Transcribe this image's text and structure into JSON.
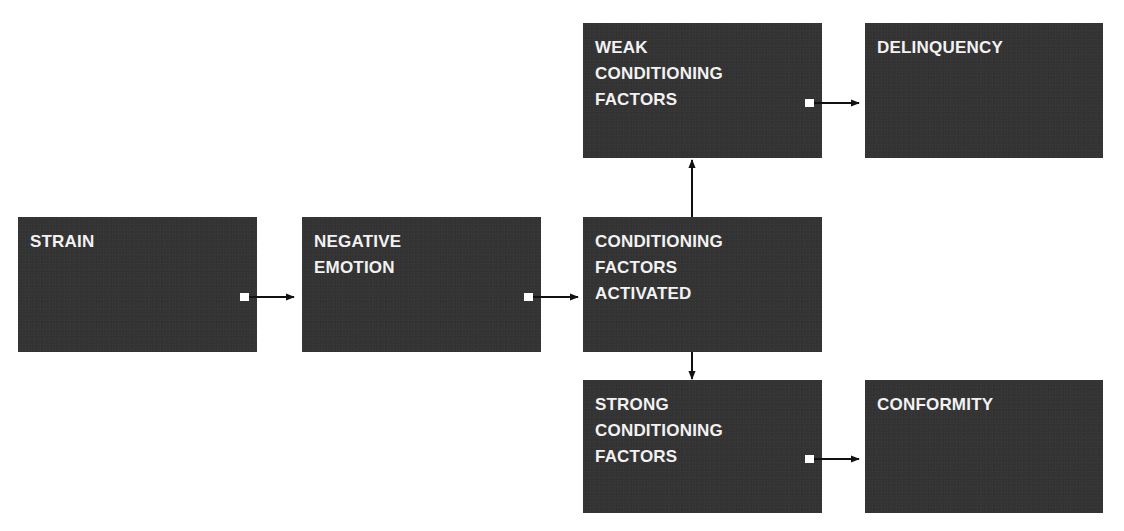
{
  "diagram": {
    "type": "flowchart",
    "box_fill": "#343434",
    "text_color": "#f2f2f2",
    "arrow_color": "#111111",
    "nodes": [
      {
        "id": "strain",
        "label": "STRAIN"
      },
      {
        "id": "negative_emotion",
        "label": "NEGATIVE\nEMOTION"
      },
      {
        "id": "conditioning_activated",
        "label": "CONDITIONING\nFACTORS\nACTIVATED"
      },
      {
        "id": "weak_conditioning",
        "label": "WEAK\nCONDITIONING\nFACTORS"
      },
      {
        "id": "strong_conditioning",
        "label": "STRONG\nCONDITIONING\nFACTORS"
      },
      {
        "id": "delinquency",
        "label": "DELINQUENCY"
      },
      {
        "id": "conformity",
        "label": "CONFORMITY"
      }
    ],
    "edges": [
      {
        "from": "strain",
        "to": "negative_emotion"
      },
      {
        "from": "negative_emotion",
        "to": "conditioning_activated"
      },
      {
        "from": "conditioning_activated",
        "to": "weak_conditioning"
      },
      {
        "from": "conditioning_activated",
        "to": "strong_conditioning"
      },
      {
        "from": "weak_conditioning",
        "to": "delinquency"
      },
      {
        "from": "strong_conditioning",
        "to": "conformity"
      }
    ]
  }
}
